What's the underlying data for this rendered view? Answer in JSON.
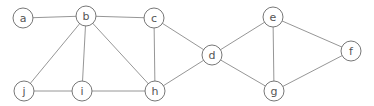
{
  "graph": {
    "nodes": [
      {
        "id": "a",
        "label": "a",
        "x": 23,
        "y": 18
      },
      {
        "id": "b",
        "label": "b",
        "x": 86,
        "y": 16
      },
      {
        "id": "c",
        "label": "c",
        "x": 154,
        "y": 18
      },
      {
        "id": "d",
        "label": "d",
        "x": 212,
        "y": 55
      },
      {
        "id": "e",
        "label": "e",
        "x": 273,
        "y": 17
      },
      {
        "id": "f",
        "label": "f",
        "x": 351,
        "y": 51
      },
      {
        "id": "g",
        "label": "g",
        "x": 274,
        "y": 91
      },
      {
        "id": "h",
        "label": "h",
        "x": 155,
        "y": 91
      },
      {
        "id": "i",
        "label": "i",
        "x": 82,
        "y": 91
      },
      {
        "id": "j",
        "label": "j",
        "x": 24,
        "y": 91
      }
    ],
    "edges": [
      [
        "a",
        "b"
      ],
      [
        "b",
        "c"
      ],
      [
        "b",
        "j"
      ],
      [
        "b",
        "i"
      ],
      [
        "b",
        "h"
      ],
      [
        "c",
        "h"
      ],
      [
        "c",
        "d"
      ],
      [
        "h",
        "i"
      ],
      [
        "i",
        "j"
      ],
      [
        "h",
        "d"
      ],
      [
        "d",
        "e"
      ],
      [
        "d",
        "g"
      ],
      [
        "e",
        "g"
      ],
      [
        "e",
        "f"
      ],
      [
        "f",
        "g"
      ]
    ],
    "node_radius": 10
  }
}
